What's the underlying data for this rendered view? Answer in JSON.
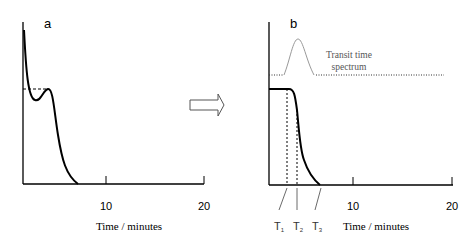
{
  "panel_a": {
    "label": "a",
    "x_ticks": [
      "10",
      "20"
    ],
    "x_axis_label": "Time / minutes"
  },
  "arrow": {
    "icon": "right-outline-arrow-icon"
  },
  "panel_b": {
    "label": "b",
    "x_ticks": [
      "10",
      "20"
    ],
    "x_axis_label": "Time / minutes",
    "spectrum_label_line1": "Transit time",
    "spectrum_label_line2": "spectrum",
    "markers": [
      {
        "main": "T",
        "sub": "1"
      },
      {
        "main": "T",
        "sub": "2"
      },
      {
        "main": "T",
        "sub": "3"
      }
    ]
  }
}
